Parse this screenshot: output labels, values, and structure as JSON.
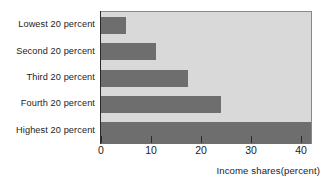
{
  "chart_data": {
    "type": "bar",
    "orientation": "horizontal",
    "title": "",
    "xlabel": "Income shares(percent)",
    "ylabel": "",
    "categories": [
      "Lowest 20 percent",
      "Second 20 percent",
      "Third 20 percent",
      "Fourth 20 percent",
      "Highest 20 percent"
    ],
    "values": [
      5,
      11,
      17.4,
      24,
      42
    ],
    "xlim": [
      0,
      42
    ],
    "xticks": [
      0,
      10,
      20,
      30,
      40
    ],
    "xtick_labels": [
      "0",
      "10",
      "20",
      "30",
      "40"
    ],
    "grid": false,
    "legend": null,
    "colors": {
      "bar": "#6e6e6e",
      "plot_background": "#d9d9d9",
      "axis": "#2b2b2b",
      "page_background": "#ffffff",
      "text": "#1c1c1c"
    }
  }
}
